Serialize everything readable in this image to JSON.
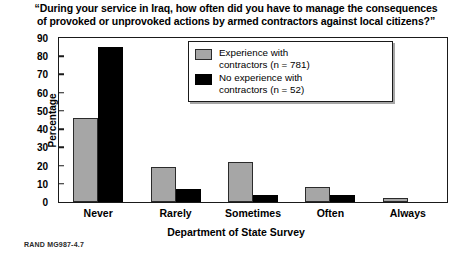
{
  "chart_data": {
    "type": "bar",
    "title": "“During your service in Iraq, how often did you have to manage the consequences of provoked or unprovoked actions by armed contractors against local citizens?”",
    "title_line1": "“During your service in Iraq, how often did you have to manage the consequences",
    "title_line2": "of provoked or unprovoked actions by armed contractors against local citizens?”",
    "xlabel": "Department of State Survey",
    "ylabel": "Percentage",
    "ylim": [
      0,
      90
    ],
    "yticks": [
      0,
      10,
      20,
      30,
      40,
      50,
      60,
      70,
      80,
      90
    ],
    "grid": false,
    "legend_position": "top-center",
    "categories": [
      "Never",
      "Rarely",
      "Sometimes",
      "Often",
      "Always"
    ],
    "series": [
      {
        "name": "Experience with contractors (n = 781)",
        "name_line1": "Experience with",
        "name_line2": "contractors (n = 781)",
        "color": "#a6a6a6",
        "values": [
          46,
          19,
          22,
          8,
          2
        ]
      },
      {
        "name": "No experience with contractors (n = 52)",
        "name_line1": "No experience with",
        "name_line2": "contractors (n = 52)",
        "color": "#000000",
        "values": [
          85,
          7,
          4,
          4,
          0
        ]
      }
    ]
  },
  "footer": {
    "credit": "RAND MG987-4.7"
  }
}
